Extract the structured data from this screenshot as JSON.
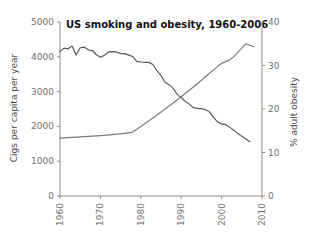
{
  "chart_data": {
    "type": "line",
    "title": "US smoking and obesity, 1960-2006",
    "xlabel": "",
    "ylabel": "Cigs per capita per year",
    "y2label": "% adult obesity",
    "xlim": [
      1960,
      2010
    ],
    "ylim": [
      0,
      5000
    ],
    "y2lim": [
      0,
      40
    ],
    "grid": false,
    "legend": "none",
    "xticks": [
      "1960",
      "1970",
      "1980",
      "1990",
      "2000",
      "2010"
    ],
    "xtick_values": [
      1960,
      1970,
      1980,
      1990,
      2000,
      2010
    ],
    "yticks": [
      "0",
      "1000",
      "2000",
      "3000",
      "4000",
      "5000"
    ],
    "ytick_values": [
      0,
      1000,
      2000,
      3000,
      4000,
      5000
    ],
    "y2ticks": [
      "0",
      "10",
      "20",
      "30",
      "40"
    ],
    "y2tick_values": [
      0,
      10,
      20,
      30,
      40
    ],
    "series": [
      {
        "name": "Cigs per capita per year",
        "axis": "left",
        "color": "#595959",
        "x": [
          1960,
          1961,
          1962,
          1963,
          1964,
          1965,
          1966,
          1967,
          1968,
          1969,
          1970,
          1971,
          1972,
          1973,
          1974,
          1975,
          1976,
          1977,
          1978,
          1979,
          1980,
          1981,
          1982,
          1983,
          1984,
          1985,
          1986,
          1987,
          1988,
          1989,
          1990,
          1991,
          1992,
          1993,
          1994,
          1995,
          1996,
          1997,
          1998,
          1999,
          2000,
          2001,
          2002,
          2003,
          2004,
          2005,
          2006,
          2007
        ],
        "values": [
          4150,
          4250,
          4230,
          4310,
          4050,
          4260,
          4280,
          4200,
          4180,
          4060,
          3990,
          4040,
          4140,
          4150,
          4140,
          4090,
          4090,
          4050,
          4010,
          3870,
          3850,
          3840,
          3840,
          3780,
          3600,
          3460,
          3270,
          3200,
          3100,
          2920,
          2830,
          2720,
          2640,
          2540,
          2520,
          2510,
          2480,
          2420,
          2260,
          2130,
          2070,
          2050,
          1980,
          1890,
          1800,
          1720,
          1640,
          1560
        ]
      },
      {
        "name": "% adult obesity",
        "axis": "right",
        "color": "#7a7a7a",
        "x": [
          1960,
          1965,
          1970,
          1975,
          1978,
          1980,
          1982,
          1984,
          1986,
          1988,
          1990,
          1992,
          1994,
          1996,
          1998,
          2000,
          2002,
          2003,
          2004,
          2005,
          2006,
          2008
        ],
        "values": [
          13.3,
          13.6,
          13.9,
          14.3,
          14.7,
          16.0,
          17.3,
          18.6,
          20.0,
          21.4,
          22.8,
          24.3,
          25.8,
          27.4,
          29.0,
          30.5,
          31.3,
          32.0,
          33.0,
          34.0,
          35.0,
          34.3
        ]
      }
    ]
  }
}
